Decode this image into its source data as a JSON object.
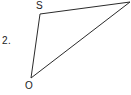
{
  "figure": {
    "problem_number": "2.",
    "background_color": "#ffffff",
    "stroke_color": "#2b2b2b",
    "stroke_width": 1,
    "width": 131,
    "height": 95,
    "vertices": [
      {
        "name": "S",
        "label": "S",
        "x": 40,
        "y": 14,
        "label_x": 36,
        "label_y": 1
      },
      {
        "name": "R",
        "label": "",
        "x": 130,
        "y": 2,
        "label_x": 0,
        "label_y": 0
      },
      {
        "name": "O",
        "label": "O",
        "x": 31,
        "y": 78,
        "label_x": 25,
        "label_y": 81
      }
    ],
    "edges": [
      {
        "name": "edge-s-r",
        "from": "S",
        "to": "R"
      },
      {
        "name": "edge-r-o",
        "from": "R",
        "to": "O"
      },
      {
        "name": "edge-o-s",
        "from": "O",
        "to": "S"
      }
    ],
    "polygon_points": "40,14 130,2 31,78"
  }
}
